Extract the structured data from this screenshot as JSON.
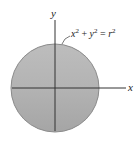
{
  "diagram": {
    "equation": {
      "x": "x",
      "plus": "+",
      "y": "y",
      "equals": "=",
      "r": "r",
      "exp": "2"
    },
    "axis_labels": {
      "x": "x",
      "y": "y"
    },
    "colors": {
      "disc_top": "#b9b9b9",
      "disc_bottom": "#a9a9a9",
      "disc_edge": "#8a8a8a",
      "axis": "#333333"
    }
  }
}
